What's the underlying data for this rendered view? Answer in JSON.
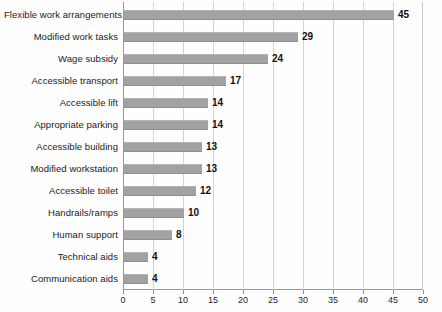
{
  "chart_data": {
    "type": "bar",
    "orientation": "horizontal",
    "title": "",
    "xlabel": "",
    "ylabel": "",
    "xlim": [
      0,
      50
    ],
    "xticks": [
      0,
      5,
      10,
      15,
      20,
      25,
      30,
      35,
      40,
      45,
      50
    ],
    "grid": true,
    "legend": null,
    "bar_color": "#a2a2a2",
    "categories": [
      "Flexible work arrangements",
      "Modified work tasks",
      "Wage subsidy",
      "Accessible transport",
      "Accessible lift",
      "Appropriate parking",
      "Accessible building",
      "Modified workstation",
      "Accessible toilet",
      "Handrails/ramps",
      "Human support",
      "Technical aids",
      "Communication aids"
    ],
    "values": [
      45,
      29,
      24,
      17,
      14,
      14,
      13,
      13,
      12,
      10,
      8,
      4,
      4
    ]
  }
}
